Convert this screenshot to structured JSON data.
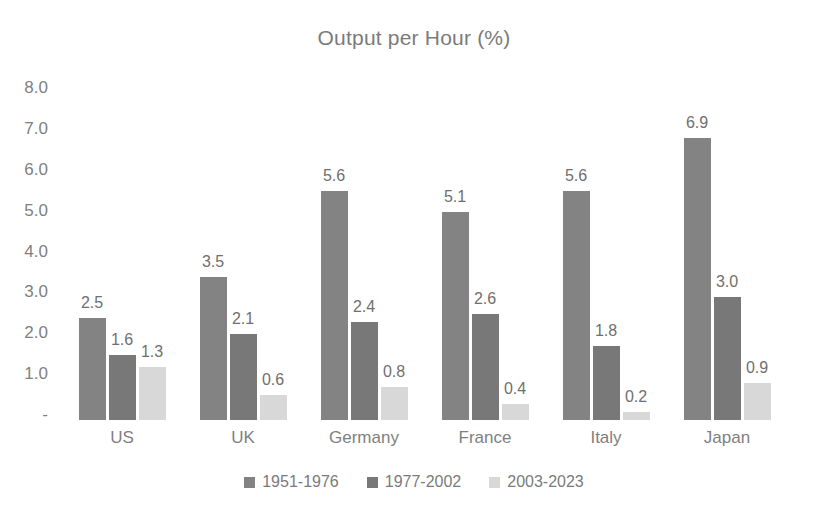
{
  "chart_data": {
    "type": "bar",
    "title": "Output per Hour (%)",
    "xlabel": "",
    "ylabel": "",
    "ylim": [
      0,
      8
    ],
    "grid": false,
    "legend_position": "bottom",
    "categories": [
      "US",
      "UK",
      "Germany",
      "France",
      "Italy",
      "Japan"
    ],
    "y_ticks": [
      "-",
      "1.0",
      "2.0",
      "3.0",
      "4.0",
      "5.0",
      "6.0",
      "7.0",
      "8.0"
    ],
    "y_tick_values": [
      0,
      1,
      2,
      3,
      4,
      5,
      6,
      7,
      8
    ],
    "series": [
      {
        "name": "1951-1976",
        "color": "#838383",
        "values": [
          2.5,
          3.5,
          5.6,
          5.1,
          5.6,
          6.9
        ],
        "labels": [
          "2.5",
          "3.5",
          "5.6",
          "5.1",
          "5.6",
          "6.9"
        ]
      },
      {
        "name": "1977-2002",
        "color": "#787878",
        "values": [
          1.6,
          2.1,
          2.4,
          2.6,
          1.8,
          3.0
        ],
        "labels": [
          "1.6",
          "2.1",
          "2.4",
          "2.6",
          "1.8",
          "3.0"
        ]
      },
      {
        "name": "2003-2023",
        "color": "#d8d8d8",
        "values": [
          1.3,
          0.6,
          0.8,
          0.4,
          0.2,
          0.9
        ],
        "labels": [
          "1.3",
          "0.6",
          "0.8",
          "0.4",
          "0.2",
          "0.9"
        ]
      }
    ]
  }
}
